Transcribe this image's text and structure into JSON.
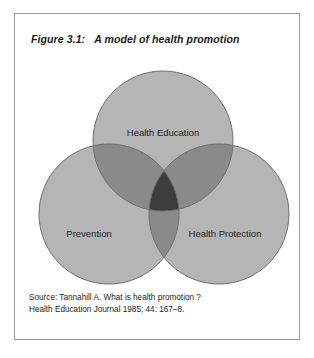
{
  "figure": {
    "number": "Figure 3.1:",
    "title": "A model of health promotion"
  },
  "diagram": {
    "type": "venn-3-circle",
    "circles": [
      {
        "id": "health-education",
        "label": "Health Education",
        "position": "top"
      },
      {
        "id": "prevention",
        "label": "Prevention",
        "position": "bottom-left"
      },
      {
        "id": "health-protection",
        "label": "Health Protection",
        "position": "bottom-right"
      }
    ],
    "colors": {
      "circle_fill": "#b5b5b5",
      "double_overlap": "#8a8a8a",
      "triple_overlap": "#3d3d3d",
      "outline": "#6f6f6f",
      "frame_border": "#9a9a9a",
      "background": "#ffffff",
      "text": "#1d1d1d"
    }
  },
  "source": {
    "line1": "Source: Tannahill A. What is health promotion ?",
    "line2": "Health Education  Journal 1985; 44: 167–8."
  }
}
